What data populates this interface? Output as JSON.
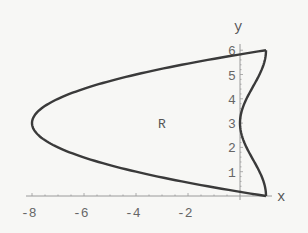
{
  "chart_data": {
    "type": "line",
    "title": "",
    "xlabel": "x",
    "ylabel": "y",
    "xlim": [
      -8.3,
      1.4
    ],
    "ylim": [
      0,
      6.3
    ],
    "x_ticks": [
      -8,
      -6,
      -4,
      -2
    ],
    "x_tick_labels": [
      "-8",
      "-6",
      "-4",
      "-2"
    ],
    "y_ticks": [
      1,
      2,
      3,
      4,
      5,
      6
    ],
    "y_tick_labels": [
      "1",
      "2",
      "3",
      "4",
      "5",
      "6"
    ],
    "grid": false,
    "legend": null,
    "annotations": [
      {
        "text": "R",
        "x": -3.0,
        "y": 3.0
      }
    ],
    "series": [
      {
        "name": "left boundary",
        "equation": "x = y^2 - 6y + 1",
        "points": [
          [
            1,
            0
          ],
          [
            -4,
            1
          ],
          [
            -7,
            2
          ],
          [
            -8,
            3
          ],
          [
            -7,
            4
          ],
          [
            -4,
            5
          ],
          [
            1,
            6
          ]
        ]
      },
      {
        "name": "right boundary",
        "equation": "x = cos^2(pi*y/6)",
        "points": [
          [
            1,
            0
          ],
          [
            0.75,
            1
          ],
          [
            0.25,
            2
          ],
          [
            0,
            3
          ],
          [
            0.25,
            4
          ],
          [
            0.75,
            5
          ],
          [
            1,
            6
          ]
        ]
      }
    ],
    "region": "R bounded between the two curves for 0 <= y <= 6"
  },
  "labels": {
    "x_axis": "x",
    "y_axis": "y",
    "region": "R",
    "xticks": [
      "-8",
      "-6",
      "-4",
      "-2"
    ],
    "yticks": [
      "1",
      "2",
      "3",
      "4",
      "5",
      "6"
    ]
  },
  "colors": {
    "curve": "#3a3a3a",
    "axis": "#9a9a9a",
    "text": "#666666"
  }
}
